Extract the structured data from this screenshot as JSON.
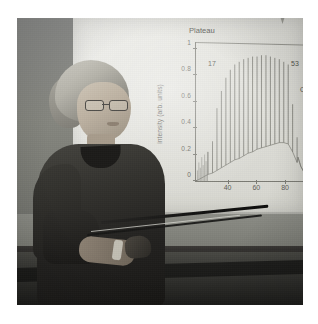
{
  "scene": {
    "description": "Photograph of a woman presenting a slide showing a high-harmonic generation spectrum",
    "presenter_label": "presenter",
    "pointer_label": "pointer-stick",
    "podium_label": "podium",
    "screen_label": "projection-screen"
  },
  "colors": {
    "page_background": "#ffffff",
    "wall_left": "#85867f",
    "wall_right": "#b9b9b4",
    "screen": "#e5e5df",
    "plot_ink": "#7c7c75",
    "podium_dark": "#1d1d1b",
    "pointer": "#1b1b19"
  },
  "chart_data": {
    "type": "line",
    "title": "",
    "xlabel": "energy (eV)",
    "ylabel": "intensity (arb. units)",
    "xlim": [
      18,
      112
    ],
    "ylim": [
      0,
      1.05
    ],
    "xticks": [
      40,
      60,
      80,
      100
    ],
    "xtick_labels": [
      "40",
      "60",
      "80",
      "100"
    ],
    "yticks": [
      0,
      0.2,
      0.4,
      0.6,
      0.8,
      1
    ],
    "ytick_labels": [
      "0",
      "0.2",
      "0.4",
      "0.6",
      "0.8",
      "1"
    ],
    "grid": false,
    "legend": null,
    "annotations": [
      {
        "text": "Plateau",
        "x": 32,
        "y": 1.04
      },
      {
        "text": "17",
        "x": 33,
        "y": 0.83
      },
      {
        "text": "53",
        "x": 90,
        "y": 0.83
      },
      {
        "text": "Cutoff",
        "x": 97,
        "y": 0.63
      }
    ],
    "series": [
      {
        "name": "harmonic comb",
        "comment": "odd harmonic orders 17-57 of an 800 nm driver; each x is harmonic photon energy in eV, y is peak intensity in arb. units",
        "harmonic_orders": [
          17,
          19,
          21,
          23,
          25,
          27,
          29,
          31,
          33,
          35,
          37,
          39,
          41,
          43,
          45,
          47,
          49,
          51,
          53,
          55,
          57
        ],
        "x": [
          26.4,
          29.5,
          32.6,
          35.7,
          38.8,
          41.9,
          45.0,
          48.1,
          51.2,
          54.3,
          57.4,
          60.5,
          63.6,
          66.7,
          69.8,
          72.9,
          76.0,
          79.1,
          82.2,
          85.3,
          88.4
        ],
        "y": [
          0.22,
          0.3,
          0.55,
          0.68,
          0.78,
          0.84,
          0.88,
          0.9,
          0.92,
          0.93,
          0.94,
          0.94,
          0.95,
          0.95,
          0.94,
          0.93,
          0.92,
          0.9,
          0.88,
          0.58,
          0.33
        ],
        "baseline": [
          0.05,
          0.06,
          0.08,
          0.1,
          0.12,
          0.14,
          0.16,
          0.17,
          0.19,
          0.21,
          0.22,
          0.24,
          0.25,
          0.26,
          0.27,
          0.28,
          0.29,
          0.29,
          0.28,
          0.22,
          0.14
        ]
      },
      {
        "name": "low-order noise",
        "comment": "unresolved dense structure below 26 eV",
        "x": [
          19,
          20,
          21,
          22,
          23,
          24,
          25,
          26
        ],
        "y": [
          0.08,
          0.14,
          0.1,
          0.18,
          0.12,
          0.2,
          0.15,
          0.22
        ]
      },
      {
        "name": "cutoff tail",
        "comment": "rapid decay beyond the cutoff harmonic",
        "x": [
          89,
          91,
          93,
          95,
          98,
          102,
          108,
          112
        ],
        "y": [
          0.18,
          0.11,
          0.07,
          0.05,
          0.035,
          0.025,
          0.02,
          0.018
        ]
      }
    ]
  }
}
